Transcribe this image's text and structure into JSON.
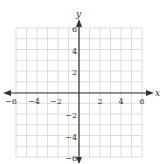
{
  "chart_data": {
    "type": "scatter",
    "title": "",
    "xlabel": "x",
    "ylabel": "y",
    "xlim": [
      -6,
      6
    ],
    "ylim": [
      -6,
      6
    ],
    "grid": true,
    "grid_step": 1,
    "x_tick_labels": [
      "-6",
      "-4",
      "-2",
      "2",
      "4",
      "6"
    ],
    "y_tick_labels": [
      "6",
      "4",
      "2",
      "-2",
      "-4",
      "-6"
    ],
    "series": [],
    "x": [],
    "values": []
  },
  "axes": {
    "x_label": "x",
    "y_label": "y"
  },
  "ticks": {
    "x": [
      {
        "value": -6,
        "label": "−6"
      },
      {
        "value": -4,
        "label": "−4"
      },
      {
        "value": -2,
        "label": "−2"
      },
      {
        "value": 2,
        "label": "2"
      },
      {
        "value": 4,
        "label": "4"
      },
      {
        "value": 6,
        "label": "6"
      }
    ],
    "y": [
      {
        "value": 6,
        "label": "6"
      },
      {
        "value": 4,
        "label": "4"
      },
      {
        "value": 2,
        "label": "2"
      },
      {
        "value": -2,
        "label": "−2"
      },
      {
        "value": -4,
        "label": "−4"
      },
      {
        "value": -6,
        "label": "−6"
      }
    ]
  },
  "colors": {
    "grid": "#d4d4d4",
    "axis": "#333333",
    "text": "#333333"
  }
}
